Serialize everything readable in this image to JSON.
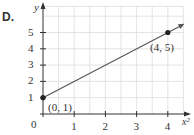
{
  "panel_label": "D.",
  "chart_data": {
    "type": "line",
    "title": "",
    "xlabel": "x²",
    "ylabel": "y",
    "xlim": [
      0,
      4.5
    ],
    "ylim": [
      0,
      6
    ],
    "x_ticks": [
      "1",
      "2",
      "3",
      "4"
    ],
    "y_ticks": [
      "1",
      "2",
      "3",
      "4",
      "5"
    ],
    "origin_label": "0",
    "grid": true,
    "series": [
      {
        "name": "line",
        "x": [
          0,
          4
        ],
        "y": [
          1,
          5
        ],
        "extends_with_arrow": true
      }
    ],
    "points": [
      {
        "x": 0,
        "y": 1,
        "label": "(0, 1)"
      },
      {
        "x": 4,
        "y": 5,
        "label": "(4, 5)"
      }
    ],
    "colors": {
      "grid": "#dddddd",
      "axis": "#333333",
      "line": "#555555",
      "point": "#222222"
    }
  }
}
